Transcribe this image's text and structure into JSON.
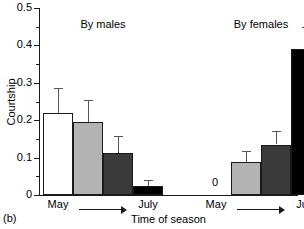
{
  "panel": {
    "label": "(b)"
  },
  "chart_data": {
    "type": "bar",
    "title": "",
    "xlabel": "Time of season",
    "ylabel": "Courtship",
    "ylim": [
      0,
      0.5
    ],
    "ytick_labels": [
      "0",
      "0.1",
      "0.2",
      "0.3",
      "0.4",
      "0.5"
    ],
    "ytick_values": [
      0,
      0.1,
      0.2,
      0.3,
      0.4,
      0.5
    ],
    "yminor_values": [
      0.05,
      0.15,
      0.25,
      0.35,
      0.45
    ],
    "grid": false,
    "legend": "none",
    "groups": [
      {
        "name": "By males",
        "start_label": "May",
        "end_label": "July",
        "bars": [
          {
            "label": "May",
            "value": 0.22,
            "error": 0.065,
            "color": "#ffffff",
            "zero_annotation": ""
          },
          {
            "label": "",
            "value": 0.195,
            "error": 0.06,
            "color": "#b3b3b3",
            "zero_annotation": ""
          },
          {
            "label": "",
            "value": 0.113,
            "error": 0.045,
            "color": "#3a3a3a",
            "zero_annotation": ""
          },
          {
            "label": "July",
            "value": 0.025,
            "error": 0.015,
            "color": "#000000",
            "zero_annotation": ""
          }
        ]
      },
      {
        "name": "By females",
        "start_label": "May",
        "end_label": "July",
        "bars": [
          {
            "label": "May",
            "value": 0.0,
            "error": 0.0,
            "color": "#ffffff",
            "zero_annotation": "0"
          },
          {
            "label": "",
            "value": 0.088,
            "error": 0.03,
            "color": "#b3b3b3",
            "zero_annotation": ""
          },
          {
            "label": "",
            "value": 0.135,
            "error": 0.035,
            "color": "#3a3a3a",
            "zero_annotation": ""
          },
          {
            "label": "July",
            "value": 0.39,
            "error": 0.06,
            "color": "#000000",
            "zero_annotation": ""
          }
        ]
      }
    ]
  }
}
